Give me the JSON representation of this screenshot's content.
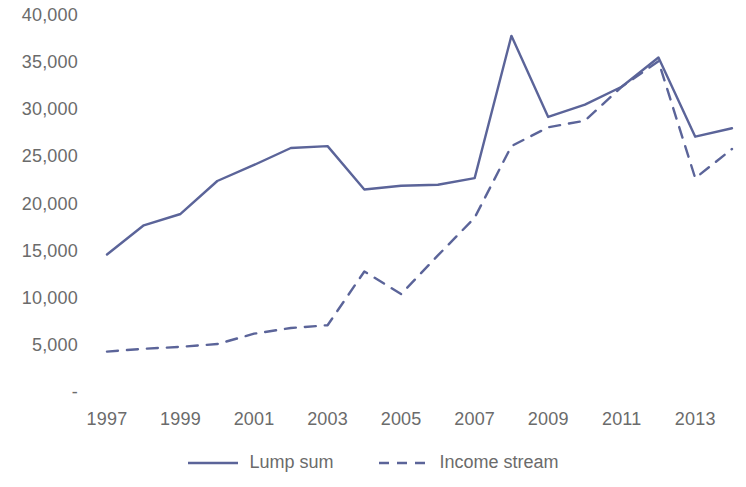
{
  "chart_data": {
    "type": "line",
    "title": "",
    "subtitle": "",
    "xlabel": "",
    "ylabel": "",
    "x": [
      1997,
      1998,
      1999,
      2000,
      2001,
      2002,
      2003,
      2004,
      2005,
      2006,
      2007,
      2008,
      2009,
      2010,
      2011,
      2012,
      2013,
      2014
    ],
    "xtick_labels": [
      "1997",
      "1999",
      "2001",
      "2003",
      "2005",
      "2007",
      "2009",
      "2011",
      "2013"
    ],
    "xtick_values": [
      1997,
      1999,
      2001,
      2003,
      2005,
      2007,
      2009,
      2011,
      2013
    ],
    "xlim": [
      1997,
      2014
    ],
    "ytick_labels": [
      "40,000",
      "35,000",
      "30,000",
      "25,000",
      "20,000",
      "15,000",
      "10,000",
      "5,000",
      "-"
    ],
    "ytick_values": [
      40000,
      35000,
      30000,
      25000,
      20000,
      15000,
      10000,
      5000,
      0
    ],
    "ylim": [
      0,
      40000
    ],
    "grid": false,
    "legend_position": "bottom",
    "series": [
      {
        "name": "Lump sum",
        "style": "solid",
        "color": "#5B6499",
        "values": [
          14800,
          17900,
          19100,
          22600,
          24300,
          26100,
          26300,
          21700,
          22100,
          22200,
          22900,
          38000,
          29400,
          30700,
          32600,
          35700,
          27300,
          28200
        ]
      },
      {
        "name": "Income stream",
        "style": "dashed",
        "color": "#5B6499",
        "values": [
          4500,
          4800,
          5000,
          5300,
          6400,
          7000,
          7300,
          13000,
          10600,
          14700,
          18700,
          26300,
          28300,
          29000,
          32600,
          35300,
          22900,
          26000
        ]
      }
    ]
  },
  "legend": {
    "items": [
      {
        "label": "Lump sum",
        "style": "solid"
      },
      {
        "label": "Income stream",
        "style": "dashed"
      }
    ]
  },
  "colors": {
    "series_line": "#5B6499",
    "tick_text": "#6b6b6b",
    "background": "#ffffff"
  }
}
